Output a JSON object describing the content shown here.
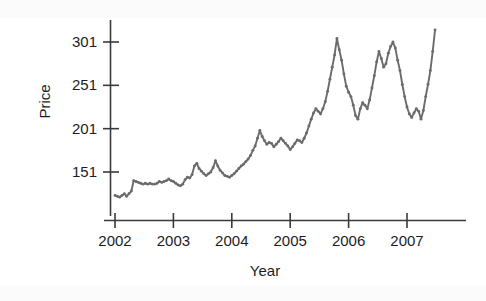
{
  "chart_data": {
    "type": "line",
    "title": "",
    "subtitle": "",
    "xlabel": "Year",
    "ylabel": "Price",
    "xlim": [
      2001.85,
      2007.6
    ],
    "ylim": [
      118,
      320
    ],
    "grid": false,
    "legend": null,
    "marker": "filled-circle",
    "line_color": "#6b6b6b",
    "axis_color": "#3a3a3a",
    "text_color": "#1d1d1d",
    "xticks": [
      2002,
      2003,
      2004,
      2005,
      2006,
      2007
    ],
    "xtick_labels": [
      "2002",
      "2003",
      "2004",
      "2005",
      "2006",
      "2007"
    ],
    "yticks": [
      151,
      201,
      251,
      301
    ],
    "ytick_labels": [
      "151",
      "201",
      "251",
      "301"
    ],
    "x": [
      2002.0,
      2002.04,
      2002.08,
      2002.12,
      2002.16,
      2002.2,
      2002.24,
      2002.28,
      2002.32,
      2002.36,
      2002.4,
      2002.44,
      2002.48,
      2002.52,
      2002.56,
      2002.6,
      2002.64,
      2002.68,
      2002.72,
      2002.76,
      2002.8,
      2002.84,
      2002.88,
      2002.92,
      2002.96,
      2003.0,
      2003.04,
      2003.08,
      2003.12,
      2003.16,
      2003.2,
      2003.24,
      2003.28,
      2003.32,
      2003.36,
      2003.4,
      2003.44,
      2003.48,
      2003.52,
      2003.56,
      2003.6,
      2003.64,
      2003.68,
      2003.72,
      2003.76,
      2003.8,
      2003.84,
      2003.88,
      2003.92,
      2003.96,
      2004.0,
      2004.04,
      2004.08,
      2004.12,
      2004.16,
      2004.2,
      2004.24,
      2004.28,
      2004.32,
      2004.36,
      2004.4,
      2004.44,
      2004.48,
      2004.52,
      2004.56,
      2004.6,
      2004.64,
      2004.68,
      2004.72,
      2004.76,
      2004.8,
      2004.84,
      2004.88,
      2004.92,
      2004.96,
      2005.0,
      2005.04,
      2005.08,
      2005.12,
      2005.16,
      2005.2,
      2005.24,
      2005.28,
      2005.32,
      2005.36,
      2005.4,
      2005.44,
      2005.48,
      2005.52,
      2005.56,
      2005.6,
      2005.64,
      2005.68,
      2005.72,
      2005.76,
      2005.8,
      2005.84,
      2005.88,
      2005.92,
      2005.96,
      2006.0,
      2006.04,
      2006.08,
      2006.12,
      2006.16,
      2006.2,
      2006.24,
      2006.28,
      2006.32,
      2006.36,
      2006.4,
      2006.44,
      2006.48,
      2006.52,
      2006.56,
      2006.6,
      2006.64,
      2006.68,
      2006.72,
      2006.76,
      2006.8,
      2006.84,
      2006.88,
      2006.92,
      2006.96,
      2007.0,
      2007.04,
      2007.08,
      2007.12,
      2007.16,
      2007.2,
      2007.24,
      2007.28,
      2007.32,
      2007.36,
      2007.4,
      2007.44,
      2007.48
    ],
    "y": [
      124,
      123,
      122,
      124,
      126,
      123,
      126,
      129,
      141,
      140,
      139,
      138,
      137,
      138,
      137,
      138,
      137,
      137,
      138,
      140,
      139,
      140,
      141,
      143,
      141,
      140,
      138,
      136,
      135,
      137,
      142,
      145,
      144,
      148,
      158,
      161,
      155,
      152,
      149,
      147,
      149,
      151,
      156,
      164,
      158,
      153,
      150,
      147,
      146,
      145,
      147,
      149,
      152,
      155,
      158,
      160,
      163,
      166,
      170,
      176,
      181,
      190,
      199,
      192,
      187,
      183,
      185,
      184,
      180,
      183,
      186,
      190,
      187,
      184,
      181,
      177,
      180,
      184,
      188,
      187,
      185,
      190,
      196,
      204,
      212,
      219,
      224,
      221,
      218,
      224,
      232,
      244,
      258,
      272,
      286,
      305,
      292,
      280,
      264,
      250,
      243,
      238,
      228,
      216,
      212,
      224,
      231,
      228,
      224,
      234,
      248,
      262,
      278,
      290,
      282,
      272,
      276,
      288,
      296,
      301,
      294,
      280,
      268,
      252,
      238,
      226,
      218,
      214,
      219,
      224,
      221,
      212,
      222,
      238,
      252,
      268,
      290,
      315
    ]
  },
  "axis_labels": {
    "y_title": "Price",
    "x_title": "Year"
  }
}
